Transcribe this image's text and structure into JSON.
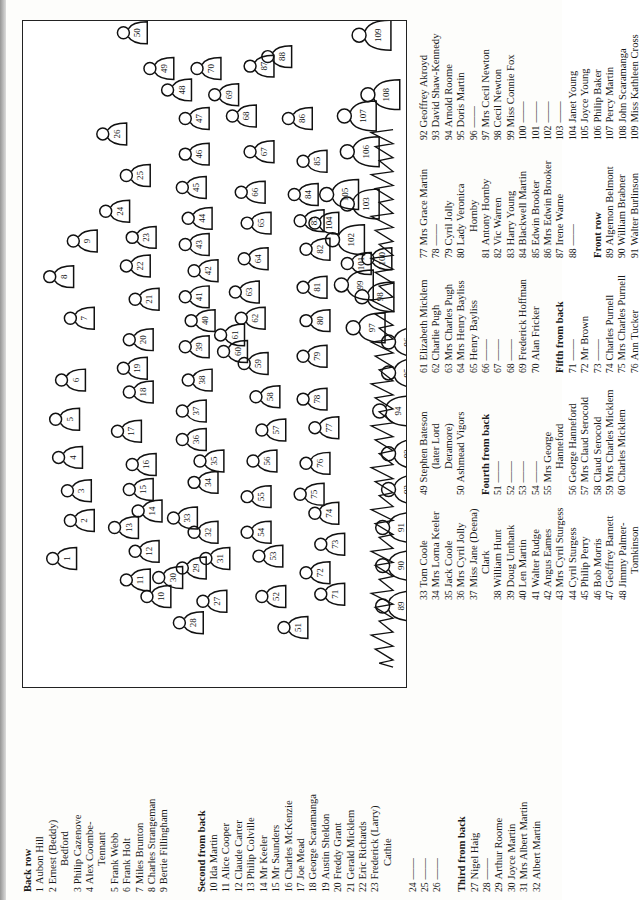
{
  "diagram": {
    "figures": [
      {
        "n": "1"
      },
      {
        "n": "2"
      },
      {
        "n": "3"
      },
      {
        "n": "4"
      },
      {
        "n": "5"
      },
      {
        "n": "6"
      },
      {
        "n": "7"
      },
      {
        "n": "8"
      },
      {
        "n": "9"
      },
      {
        "n": "10"
      },
      {
        "n": "11"
      },
      {
        "n": "12"
      },
      {
        "n": "13"
      },
      {
        "n": "14"
      },
      {
        "n": "15"
      },
      {
        "n": "16"
      },
      {
        "n": "17"
      },
      {
        "n": "18"
      },
      {
        "n": "19"
      },
      {
        "n": "20"
      },
      {
        "n": "21"
      },
      {
        "n": "22"
      },
      {
        "n": "23"
      },
      {
        "n": "24"
      },
      {
        "n": "25"
      },
      {
        "n": "26"
      },
      {
        "n": "27"
      },
      {
        "n": "28"
      },
      {
        "n": "29"
      },
      {
        "n": "30"
      },
      {
        "n": "31"
      },
      {
        "n": "32"
      },
      {
        "n": "33"
      },
      {
        "n": "34"
      },
      {
        "n": "35"
      },
      {
        "n": "36"
      },
      {
        "n": "37"
      },
      {
        "n": "38"
      },
      {
        "n": "39"
      },
      {
        "n": "40"
      },
      {
        "n": "41"
      },
      {
        "n": "42"
      },
      {
        "n": "43"
      },
      {
        "n": "44"
      },
      {
        "n": "45"
      },
      {
        "n": "46"
      },
      {
        "n": "47"
      },
      {
        "n": "48"
      },
      {
        "n": "49"
      },
      {
        "n": "50"
      },
      {
        "n": "51"
      },
      {
        "n": "52"
      },
      {
        "n": "53"
      },
      {
        "n": "54"
      },
      {
        "n": "55"
      },
      {
        "n": "56"
      },
      {
        "n": "57"
      },
      {
        "n": "58"
      },
      {
        "n": "59"
      },
      {
        "n": "60"
      },
      {
        "n": "61"
      },
      {
        "n": "62"
      },
      {
        "n": "63"
      },
      {
        "n": "64"
      },
      {
        "n": "65"
      },
      {
        "n": "66"
      },
      {
        "n": "67"
      },
      {
        "n": "68"
      },
      {
        "n": "69"
      },
      {
        "n": "70"
      },
      {
        "n": "71"
      },
      {
        "n": "72"
      },
      {
        "n": "73"
      },
      {
        "n": "74"
      },
      {
        "n": "75"
      },
      {
        "n": "76"
      },
      {
        "n": "77"
      },
      {
        "n": "78"
      },
      {
        "n": "79"
      },
      {
        "n": "80"
      },
      {
        "n": "81"
      },
      {
        "n": "82"
      },
      {
        "n": "83"
      },
      {
        "n": "84"
      },
      {
        "n": "85"
      },
      {
        "n": "86"
      },
      {
        "n": "87"
      },
      {
        "n": "88"
      },
      {
        "n": "89"
      },
      {
        "n": "90"
      },
      {
        "n": "91"
      },
      {
        "n": "92"
      },
      {
        "n": "93"
      },
      {
        "n": "94"
      },
      {
        "n": "95"
      },
      {
        "n": "96"
      },
      {
        "n": "97"
      },
      {
        "n": "98"
      },
      {
        "n": "99"
      },
      {
        "n": "100"
      },
      {
        "n": "101"
      },
      {
        "n": "102"
      },
      {
        "n": "103"
      },
      {
        "n": "104"
      },
      {
        "n": "105"
      },
      {
        "n": "106"
      },
      {
        "n": "107"
      },
      {
        "n": "108"
      },
      {
        "n": "109"
      }
    ]
  },
  "columns": [
    {
      "items": [
        {
          "type": "heading",
          "text": "Back row"
        },
        {
          "type": "entry",
          "num": "1",
          "name": "Aubon Hill"
        },
        {
          "type": "entry",
          "num": "2",
          "name": "Ernest (Beddy)",
          "cont": "Bedford"
        },
        {
          "type": "entry",
          "num": "3",
          "name": "Philip Cazenove"
        },
        {
          "type": "entry",
          "num": "4",
          "name": "Alex Coombe-",
          "cont": "Tennant"
        },
        {
          "type": "entry",
          "num": "5",
          "name": "Frank Webb"
        },
        {
          "type": "entry",
          "num": "6",
          "name": "Frank Holt"
        },
        {
          "type": "entry",
          "num": "7",
          "name": "Miles Brunton"
        },
        {
          "type": "entry",
          "num": "8",
          "name": "Charles Strangeman"
        },
        {
          "type": "entry",
          "num": "9",
          "name": "Bertie Fillingham"
        },
        {
          "type": "gap"
        },
        {
          "type": "gap"
        },
        {
          "type": "heading",
          "text": "Second from back"
        },
        {
          "type": "entry",
          "num": "10",
          "name": "Ida Martin"
        },
        {
          "type": "entry",
          "num": "11",
          "name": "Alice Cooper"
        },
        {
          "type": "entry",
          "num": "12",
          "name": "Claude Carter"
        },
        {
          "type": "entry",
          "num": "13",
          "name": "Philip Colville"
        },
        {
          "type": "entry",
          "num": "14",
          "name": "Mr Keeler"
        },
        {
          "type": "entry",
          "num": "15",
          "name": "Mr Saunders"
        },
        {
          "type": "entry",
          "num": "16",
          "name": "Charles McKenzie"
        },
        {
          "type": "entry",
          "num": "17",
          "name": "Joe Mead"
        },
        {
          "type": "entry",
          "num": "18",
          "name": "George Scaramanga"
        },
        {
          "type": "entry",
          "num": "19",
          "name": "Austin Sheldon"
        },
        {
          "type": "entry",
          "num": "20",
          "name": "Freddy Grant"
        },
        {
          "type": "entry",
          "num": "21",
          "name": "Gerald Micklem"
        },
        {
          "type": "entry",
          "num": "22",
          "name": "Eric Richards"
        },
        {
          "type": "entry",
          "num": "23",
          "name": "Frederick (Larry)",
          "cont": "Cathie"
        },
        {
          "type": "gap"
        },
        {
          "type": "entry",
          "num": "24",
          "name": "——"
        },
        {
          "type": "entry",
          "num": "25",
          "name": "——"
        },
        {
          "type": "entry",
          "num": "26",
          "name": "——"
        },
        {
          "type": "gap"
        },
        {
          "type": "heading",
          "text": "Third from back"
        },
        {
          "type": "entry",
          "num": "27",
          "name": "Nigel Haig"
        },
        {
          "type": "entry",
          "num": "28",
          "name": "——"
        },
        {
          "type": "entry",
          "num": "29",
          "name": "Arthur Roome"
        },
        {
          "type": "entry",
          "num": "30",
          "name": "Joyce Martin"
        },
        {
          "type": "entry",
          "num": "31",
          "name": "Mrs Albert Martin"
        },
        {
          "type": "entry",
          "num": "32",
          "name": "Albert Martin"
        }
      ]
    },
    {
      "items": [
        {
          "type": "entry",
          "num": "33",
          "name": "Tom Coole"
        },
        {
          "type": "entry",
          "num": "34",
          "name": "Mrs Lorna Keeler"
        },
        {
          "type": "entry",
          "num": "35",
          "name": "Jack Coole"
        },
        {
          "type": "entry",
          "num": "36",
          "name": "Mrs Cyril Jolly"
        },
        {
          "type": "entry",
          "num": "37",
          "name": "Miss Jane (Deena)",
          "cont": "Clark"
        },
        {
          "type": "entry",
          "num": "38",
          "name": "William Hunt"
        },
        {
          "type": "entry",
          "num": "39",
          "name": "Doug Unthank"
        },
        {
          "type": "entry",
          "num": "40",
          "name": "Len Martin"
        },
        {
          "type": "entry",
          "num": "41",
          "name": "Walter Rudge"
        },
        {
          "type": "entry",
          "num": "42",
          "name": "Angus Eames"
        },
        {
          "type": "entry",
          "num": "43",
          "name": "Mrs Cyril Sturgess"
        },
        {
          "type": "entry",
          "num": "44",
          "name": "Cyril Sturgess"
        },
        {
          "type": "entry",
          "num": "45",
          "name": "Philip Perry"
        },
        {
          "type": "entry",
          "num": "46",
          "name": "Bob Morris"
        },
        {
          "type": "entry",
          "num": "47",
          "name": "Geoffrey Barnett"
        },
        {
          "type": "entry",
          "num": "48",
          "name": "Jimmy Palmer-",
          "cont": "Tomkinson"
        }
      ]
    },
    {
      "items": [
        {
          "type": "entry",
          "num": "49",
          "name": "Stephen Bateson",
          "cont": "(later Lord",
          "cont2": "Deramore)"
        },
        {
          "type": "entry",
          "num": "50",
          "name": "Ashmead Vigors"
        },
        {
          "type": "gap"
        },
        {
          "type": "heading",
          "text": "Fourth from back"
        },
        {
          "type": "entry",
          "num": "51",
          "name": "——"
        },
        {
          "type": "entry",
          "num": "52",
          "name": "——"
        },
        {
          "type": "entry",
          "num": "53",
          "name": "——"
        },
        {
          "type": "entry",
          "num": "54",
          "name": "——"
        },
        {
          "type": "entry",
          "num": "55",
          "name": "Mrs George",
          "cont": "Hanneford"
        },
        {
          "type": "entry",
          "num": "56",
          "name": "George Hanneford"
        },
        {
          "type": "entry",
          "num": "57",
          "name": "Mrs Claud Serocold"
        },
        {
          "type": "entry",
          "num": "58",
          "name": "Claud Serocold"
        },
        {
          "type": "entry",
          "num": "59",
          "name": "Mrs Charles Micklem"
        },
        {
          "type": "entry",
          "num": "60",
          "name": "Charles Micklem"
        }
      ]
    },
    {
      "items": [
        {
          "type": "entry",
          "num": "61",
          "name": "Elizabeth Micklem"
        },
        {
          "type": "entry",
          "num": "62",
          "name": "Charlie Pugh"
        },
        {
          "type": "entry",
          "num": "63",
          "name": "Mrs Charles Pugh"
        },
        {
          "type": "entry",
          "num": "64",
          "name": "Mrs Henry Bayliss"
        },
        {
          "type": "entry",
          "num": "65",
          "name": "Henry Bayliss"
        },
        {
          "type": "entry",
          "num": "66",
          "name": "——"
        },
        {
          "type": "entry",
          "num": "67",
          "name": "——"
        },
        {
          "type": "entry",
          "num": "68",
          "name": "——"
        },
        {
          "type": "entry",
          "num": "69",
          "name": "Frederick Hoffman"
        },
        {
          "type": "entry",
          "num": "70",
          "name": "Alan Fricker"
        },
        {
          "type": "gap"
        },
        {
          "type": "heading",
          "text": "Fifth from back"
        },
        {
          "type": "entry",
          "num": "71",
          "name": "——"
        },
        {
          "type": "entry",
          "num": "72",
          "name": "Mr Brown"
        },
        {
          "type": "entry",
          "num": "73",
          "name": "——"
        },
        {
          "type": "entry",
          "num": "74",
          "name": "Charles Purnell"
        },
        {
          "type": "entry",
          "num": "75",
          "name": "Mrs Charles Purnell"
        },
        {
          "type": "entry",
          "num": "76",
          "name": "Ann Tucker"
        }
      ]
    },
    {
      "items": [
        {
          "type": "entry",
          "num": "77",
          "name": "Mrs Grace Martin"
        },
        {
          "type": "entry",
          "num": "78",
          "name": "——"
        },
        {
          "type": "entry",
          "num": "79",
          "name": "Cyril Jolly"
        },
        {
          "type": "entry",
          "num": "80",
          "name": "Lady Veronica",
          "cont": "Hornby"
        },
        {
          "type": "entry",
          "num": "81",
          "name": "Antony Hornby"
        },
        {
          "type": "entry",
          "num": "82",
          "name": "Vic Warren"
        },
        {
          "type": "entry",
          "num": "83",
          "name": "Harry Young"
        },
        {
          "type": "entry",
          "num": "84",
          "name": "Blackwell Martin"
        },
        {
          "type": "entry",
          "num": "85",
          "name": "Edwin Brooker"
        },
        {
          "type": "entry",
          "num": "86",
          "name": "Mrs Edwin Brooker"
        },
        {
          "type": "entry",
          "num": "87",
          "name": "Irene Warne"
        },
        {
          "type": "entry",
          "num": "88",
          "name": "——"
        },
        {
          "type": "gap"
        },
        {
          "type": "heading",
          "text": "Front row"
        },
        {
          "type": "entry",
          "num": "89",
          "name": "Algernon Belmont"
        },
        {
          "type": "entry",
          "num": "90",
          "name": "William Brabner"
        },
        {
          "type": "entry",
          "num": "91",
          "name": "Walter Burlinson"
        }
      ]
    },
    {
      "items": [
        {
          "type": "entry",
          "num": "92",
          "name": "Geoffrey Akroyd"
        },
        {
          "type": "entry",
          "num": "93",
          "name": "David Shaw-Kennedy"
        },
        {
          "type": "entry",
          "num": "94",
          "name": "Arnold Roome"
        },
        {
          "type": "entry",
          "num": "95",
          "name": "Doris Martin"
        },
        {
          "type": "entry",
          "num": "96",
          "name": "——"
        },
        {
          "type": "entry",
          "num": "97",
          "name": "Mrs Cecil Newton"
        },
        {
          "type": "entry",
          "num": "98",
          "name": "Cecil Newton"
        },
        {
          "type": "entry",
          "num": "99",
          "name": "Miss Connie Fox"
        },
        {
          "type": "entry",
          "num": "100",
          "name": "——"
        },
        {
          "type": "entry",
          "num": "101",
          "name": "——"
        },
        {
          "type": "entry",
          "num": "102",
          "name": "——"
        },
        {
          "type": "entry",
          "num": "103",
          "name": "——"
        },
        {
          "type": "entry",
          "num": "104",
          "name": "Janet Young"
        },
        {
          "type": "entry",
          "num": "105",
          "name": "Joyce Young"
        },
        {
          "type": "entry",
          "num": "106",
          "name": "Philip Baker"
        },
        {
          "type": "entry",
          "num": "107",
          "name": "Percy Martin"
        },
        {
          "type": "entry",
          "num": "108",
          "name": "John Scaramanga"
        },
        {
          "type": "entry",
          "num": "109",
          "name": "Miss Kathleen Cross"
        }
      ]
    }
  ]
}
